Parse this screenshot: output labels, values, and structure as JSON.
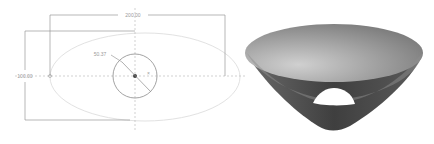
{
  "sketch": {
    "title": "2D sketch with dimensions",
    "dimensions": {
      "width_label": "200.00",
      "height_label": "100.00",
      "radius_label": "50.37"
    },
    "geometry": {
      "center": [
        135,
        76
      ],
      "circle_radius_px": 22,
      "ellipse": {
        "cx": 145,
        "cy": 77,
        "rx": 95,
        "ry": 44
      }
    },
    "colors": {
      "line": "#8c8c8c",
      "construction": "#bdbdbd",
      "ellipse": "#e4e4e4"
    }
  },
  "model": {
    "title": "3D conical bowl render",
    "shape": "truncated-cone",
    "colors": {
      "light": "#c9c9c9",
      "mid": "#8e8e8e",
      "dark": "#3f3f3f",
      "hole": "#ffffff"
    }
  }
}
